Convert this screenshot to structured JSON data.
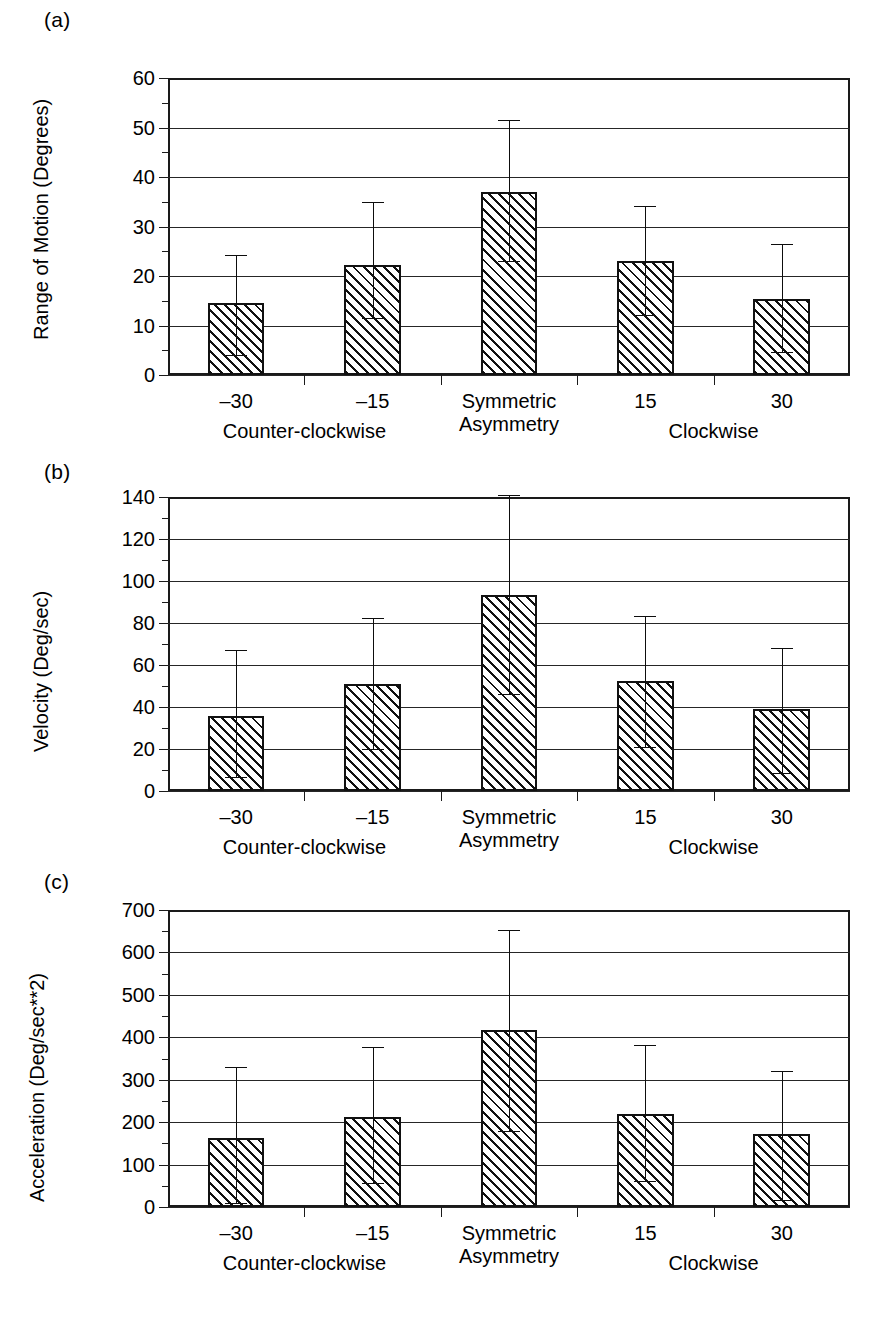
{
  "figure": {
    "panels": [
      "(a)",
      "(b)",
      "(c)"
    ]
  },
  "chart_data": [
    {
      "panel": "(a)",
      "type": "bar",
      "title": "",
      "xlabel": "",
      "ylabel": "Range of Motion (Degrees)",
      "categories": [
        "–30",
        "–15",
        "Symmetric",
        "15",
        "30"
      ],
      "group_labels": [
        "Counter-clockwise",
        "Asymmetry",
        "Clockwise"
      ],
      "category_second_line": [
        "",
        "",
        "Asymmetry",
        "",
        ""
      ],
      "values": [
        14.5,
        22.3,
        37.0,
        23.0,
        15.3
      ],
      "error_upper": [
        24.3,
        35.0,
        51.5,
        34.2,
        26.5
      ],
      "error_lower": [
        4.0,
        11.5,
        23.0,
        12.2,
        4.6
      ],
      "yticks": [
        0,
        10,
        20,
        30,
        40,
        50,
        60
      ],
      "ylim": [
        0,
        60
      ],
      "grid": true,
      "legend": "none"
    },
    {
      "panel": "(b)",
      "type": "bar",
      "title": "",
      "xlabel": "",
      "ylabel": "Velocity (Deg/sec)",
      "categories": [
        "–30",
        "–15",
        "Symmetric",
        "15",
        "30"
      ],
      "group_labels": [
        "Counter-clockwise",
        "Asymmetry",
        "Clockwise"
      ],
      "category_second_line": [
        "",
        "",
        "Asymmetry",
        "",
        ""
      ],
      "values": [
        35.5,
        51.0,
        93.5,
        52.5,
        39.0
      ],
      "error_upper": [
        67.0,
        82.5,
        141.0,
        83.5,
        68.0
      ],
      "error_lower": [
        6.5,
        20.0,
        46.0,
        21.0,
        8.5
      ],
      "yticks": [
        0,
        20,
        40,
        60,
        80,
        100,
        120,
        140
      ],
      "ylim": [
        0,
        140
      ],
      "grid": true,
      "legend": "none"
    },
    {
      "panel": "(c)",
      "type": "bar",
      "title": "",
      "xlabel": "",
      "ylabel": "Acceleration (Deg/sec**2)",
      "categories": [
        "–30",
        "–15",
        "Symmetric",
        "15",
        "30"
      ],
      "group_labels": [
        "Counter-clockwise",
        "Asymmetry",
        "Clockwise"
      ],
      "category_second_line": [
        "",
        "",
        "Asymmetry",
        "",
        ""
      ],
      "values": [
        162,
        213,
        417,
        219,
        171
      ],
      "error_upper": [
        330,
        378,
        652,
        382,
        320
      ],
      "error_lower": [
        10,
        57,
        178,
        62,
        16
      ],
      "yticks": [
        0,
        100,
        200,
        300,
        400,
        500,
        600,
        700
      ],
      "ylim": [
        0,
        700
      ],
      "grid": true,
      "legend": "none"
    }
  ]
}
